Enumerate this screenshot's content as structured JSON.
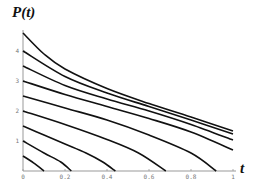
{
  "chart_data": {
    "type": "line",
    "title": "",
    "xlabel": "t",
    "ylabel": "P(t)",
    "xlim": [
      0,
      1
    ],
    "ylim": [
      0,
      4.6
    ],
    "xticks": [
      "0",
      "0.2",
      "0.4",
      "0.6",
      "0.8",
      "1"
    ],
    "yticks": [
      "1",
      "2",
      "3",
      "4"
    ],
    "grid": false,
    "legend": null,
    "series": [
      {
        "name": "P0=0.5",
        "points": [
          [
            0,
            0.5
          ],
          [
            0.05,
            0.27
          ],
          [
            0.1,
            0.0
          ]
        ]
      },
      {
        "name": "P0=1.0",
        "points": [
          [
            0,
            1.0
          ],
          [
            0.1,
            0.6
          ],
          [
            0.18,
            0.3
          ],
          [
            0.23,
            0.0
          ]
        ]
      },
      {
        "name": "P0=1.5",
        "points": [
          [
            0,
            1.5
          ],
          [
            0.1,
            1.2
          ],
          [
            0.2,
            0.9
          ],
          [
            0.3,
            0.6
          ],
          [
            0.38,
            0.3
          ],
          [
            0.44,
            0.0
          ]
        ]
      },
      {
        "name": "P0=2.0",
        "points": [
          [
            0,
            2.0
          ],
          [
            0.2,
            1.55
          ],
          [
            0.4,
            1.05
          ],
          [
            0.55,
            0.6
          ],
          [
            0.68,
            0.0
          ]
        ]
      },
      {
        "name": "P0=2.5",
        "points": [
          [
            0,
            2.5
          ],
          [
            0.2,
            2.1
          ],
          [
            0.4,
            1.7
          ],
          [
            0.6,
            1.2
          ],
          [
            0.8,
            0.6
          ],
          [
            0.92,
            0.0
          ]
        ]
      },
      {
        "name": "P0=3.0",
        "points": [
          [
            0,
            3.0
          ],
          [
            0.2,
            2.55
          ],
          [
            0.4,
            2.15
          ],
          [
            0.6,
            1.75
          ],
          [
            0.8,
            1.3
          ],
          [
            1.0,
            0.7
          ]
        ]
      },
      {
        "name": "P0=3.5",
        "points": [
          [
            0,
            3.5
          ],
          [
            0.2,
            2.85
          ],
          [
            0.4,
            2.4
          ],
          [
            0.6,
            2.0
          ],
          [
            0.8,
            1.55
          ],
          [
            1.0,
            1.03
          ]
        ]
      },
      {
        "name": "P0=4.0",
        "points": [
          [
            0,
            4.0
          ],
          [
            0.2,
            3.15
          ],
          [
            0.4,
            2.6
          ],
          [
            0.6,
            2.15
          ],
          [
            0.8,
            1.7
          ],
          [
            1.0,
            1.23
          ]
        ]
      },
      {
        "name": "P0=4.5",
        "points": [
          [
            0,
            4.6
          ],
          [
            0.1,
            3.9
          ],
          [
            0.2,
            3.4
          ],
          [
            0.4,
            2.75
          ],
          [
            0.6,
            2.25
          ],
          [
            0.8,
            1.8
          ],
          [
            1.0,
            1.33
          ]
        ]
      }
    ]
  }
}
